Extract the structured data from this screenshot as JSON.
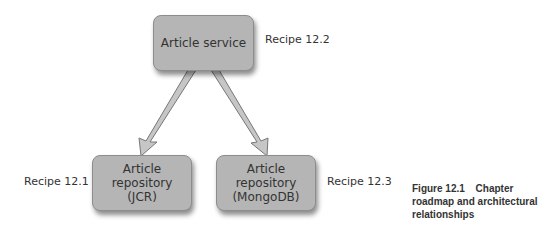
{
  "diagram": {
    "nodes": [
      {
        "id": "article-service",
        "label": "Article service",
        "recipe": "Recipe 12.2"
      },
      {
        "id": "article-repository-jcr",
        "label_lines": [
          "Article",
          "repository",
          "(JCR)"
        ],
        "recipe": "Recipe 12.1"
      },
      {
        "id": "article-repository-mongodb",
        "label_lines": [
          "Article",
          "repository",
          "(MongoDB)"
        ],
        "recipe": "Recipe 12.3"
      }
    ],
    "edges": [
      {
        "from": "article-service",
        "to": "article-repository-jcr"
      },
      {
        "from": "article-service",
        "to": "article-repository-mongodb"
      }
    ]
  },
  "caption": {
    "figure": "Figure 12.1",
    "text": "Chapter roadmap and architectural relationships"
  },
  "colors": {
    "box_fill": "#b5b5b5",
    "box_border": "#8d8d8d",
    "arrow_fill": "#c4c4c4",
    "text": "#333333"
  }
}
